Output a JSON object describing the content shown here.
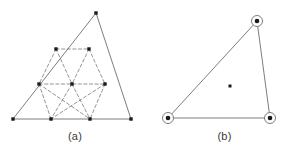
{
  "figure": {
    "background_color": "#ffffff",
    "line_color": "#6e6e6e",
    "dash_color": "#7a7a7a",
    "node_color": "#1a1a1a",
    "caption_color": "#3a3a3a"
  },
  "panels": [
    {
      "id": "a",
      "caption": "(a)",
      "description": "subdivided-triangular-lattice",
      "outline": {
        "type": "triangle",
        "vertices": [
          [
            96,
            13
          ],
          [
            13,
            119
          ],
          [
            131,
            119
          ]
        ]
      },
      "lattice_rows": [
        {
          "row": 0,
          "points": [
            [
              96,
              13
            ]
          ]
        },
        {
          "row": 1,
          "points": [
            [
              56,
              49
            ],
            [
              89,
              49
            ]
          ]
        },
        {
          "row": 2,
          "points": [
            [
              39,
              84
            ],
            [
              72,
              84
            ],
            [
              105,
              84
            ]
          ]
        },
        {
          "row": 3,
          "points": [
            [
              13,
              119
            ],
            [
              51,
              119
            ],
            [
              90,
              119
            ],
            [
              131,
              119
            ]
          ]
        }
      ],
      "solid_edges": [
        [
          [
            96,
            13
          ],
          [
            13,
            119
          ]
        ],
        [
          [
            96,
            13
          ],
          [
            131,
            119
          ]
        ],
        [
          [
            13,
            119
          ],
          [
            131,
            119
          ]
        ]
      ],
      "dashed_edges": [
        [
          [
            56,
            49
          ],
          [
            89,
            49
          ]
        ],
        [
          [
            39,
            84
          ],
          [
            105,
            84
          ]
        ],
        [
          [
            56,
            49
          ],
          [
            39,
            84
          ]
        ],
        [
          [
            56,
            49
          ],
          [
            72,
            84
          ]
        ],
        [
          [
            89,
            49
          ],
          [
            72,
            84
          ]
        ],
        [
          [
            89,
            49
          ],
          [
            105,
            84
          ]
        ],
        [
          [
            39,
            84
          ],
          [
            51,
            119
          ]
        ],
        [
          [
            39,
            84
          ],
          [
            90,
            119
          ]
        ],
        [
          [
            72,
            84
          ],
          [
            51,
            119
          ]
        ],
        [
          [
            72,
            84
          ],
          [
            90,
            119
          ]
        ],
        [
          [
            105,
            84
          ],
          [
            90,
            119
          ]
        ],
        [
          [
            105,
            84
          ],
          [
            51,
            119
          ]
        ]
      ],
      "node_marker": "filled-square",
      "node_count": 10
    },
    {
      "id": "b",
      "caption": "(b)",
      "description": "single-triangle-with-circled-vertices",
      "outline": {
        "type": "triangle",
        "vertices": [
          [
            107,
            21
          ],
          [
            18,
            118
          ],
          [
            120,
            118
          ]
        ]
      },
      "solid_edges": [
        [
          [
            107,
            21
          ],
          [
            18,
            118
          ]
        ],
        [
          [
            107,
            21
          ],
          [
            120,
            118
          ]
        ],
        [
          [
            18,
            118
          ],
          [
            120,
            118
          ]
        ]
      ],
      "vertex_marker": "circled-dot",
      "vertex_markers": [
        {
          "cx": 107,
          "cy": 21,
          "r": 5.5
        },
        {
          "cx": 18,
          "cy": 118,
          "r": 5.5
        },
        {
          "cx": 120,
          "cy": 118,
          "r": 5.5
        }
      ],
      "center_marker": "filled-square",
      "center_point": {
        "cx": 80,
        "cy": 86,
        "size": 3
      }
    }
  ]
}
